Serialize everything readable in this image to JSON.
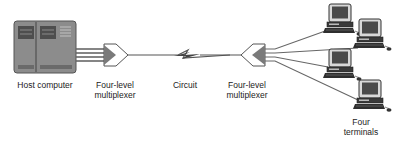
{
  "diagram": {
    "type": "multiplexed-network",
    "nodes": [
      {
        "id": "host",
        "label": "Host computer",
        "kind": "mainframe"
      },
      {
        "id": "mux-left",
        "label_line1": "Four-level",
        "label_line2": "multiplexer",
        "kind": "multiplexer"
      },
      {
        "id": "circuit",
        "label": "Circuit",
        "kind": "link"
      },
      {
        "id": "mux-right",
        "label_line1": "Four-level",
        "label_line2": "multiplexer",
        "kind": "multiplexer"
      },
      {
        "id": "terminals",
        "label_line1": "Four",
        "label_line2": "terminals",
        "kind": "terminal-group",
        "count": 4
      }
    ],
    "edges": [
      {
        "from": "host",
        "to": "mux-left",
        "lines": 4
      },
      {
        "from": "mux-left",
        "to": "mux-right",
        "via": "circuit",
        "style": "lightning"
      },
      {
        "from": "mux-right",
        "to": "terminals",
        "lines": 4
      }
    ]
  },
  "labels": {
    "host": "Host computer",
    "mux_left_1": "Four-level",
    "mux_left_2": "multiplexer",
    "circuit": "Circuit",
    "mux_right_1": "Four-level",
    "mux_right_2": "multiplexer",
    "terminals_1": "Four",
    "terminals_2": "terminals"
  },
  "colors": {
    "stroke": "#555555",
    "fill_dark": "#6e6e6e",
    "fill_mid": "#9a9a9a",
    "text": "#222222"
  }
}
